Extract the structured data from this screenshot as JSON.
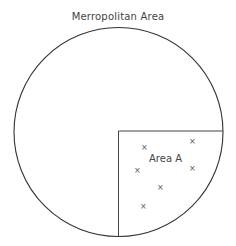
{
  "title": "Merropolitan Area",
  "region": {
    "label": "Area A",
    "marker_glyph": "×",
    "marker_count": 6
  },
  "colors": {
    "stroke": "#333333",
    "text": "#444444",
    "background": "#ffffff"
  }
}
